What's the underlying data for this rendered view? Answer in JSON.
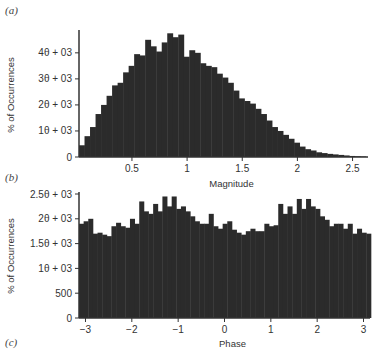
{
  "panels": {
    "a": "(a)",
    "b": "(b)",
    "c": "(c)"
  },
  "colors": {
    "bar": "#2b2b2b",
    "axis": "#333333",
    "text": "#333333"
  },
  "chart_data": [
    {
      "type": "bar",
      "panel": "(a)",
      "title": "",
      "xlabel": "Magnitude",
      "ylabel": "% of Occurrences",
      "xlim": [
        0.02,
        2.64
      ],
      "ylim": [
        0,
        4800
      ],
      "grid": false,
      "legend": null,
      "xticks": [
        0.5,
        1,
        1.5,
        2,
        2.5
      ],
      "xtick_labels": [
        "0.5",
        "1",
        "1.5",
        "2",
        "2.5"
      ],
      "yticks": [
        0,
        1000,
        2000,
        3000,
        4000
      ],
      "ytick_labels": [
        "0",
        "1θ + 03",
        "2θ + 03",
        "3θ + 03",
        "4θ + 03"
      ],
      "bin_width": 0.05,
      "x": [
        0.045,
        0.095,
        0.145,
        0.195,
        0.245,
        0.295,
        0.345,
        0.395,
        0.445,
        0.495,
        0.545,
        0.595,
        0.645,
        0.695,
        0.745,
        0.795,
        0.845,
        0.895,
        0.945,
        0.995,
        1.045,
        1.095,
        1.145,
        1.195,
        1.245,
        1.295,
        1.345,
        1.395,
        1.445,
        1.495,
        1.545,
        1.595,
        1.645,
        1.695,
        1.745,
        1.795,
        1.845,
        1.895,
        1.945,
        1.995,
        2.045,
        2.095,
        2.145,
        2.195,
        2.245,
        2.295,
        2.345,
        2.395,
        2.445,
        2.495,
        2.545,
        2.595
      ],
      "values": [
        450,
        800,
        1150,
        1650,
        2000,
        2350,
        2750,
        2850,
        3250,
        3500,
        3950,
        3900,
        4500,
        4250,
        4050,
        4400,
        4750,
        4600,
        4700,
        3850,
        4100,
        4000,
        3600,
        3500,
        3450,
        3200,
        3050,
        2850,
        2550,
        2250,
        2150,
        2050,
        1850,
        1650,
        1400,
        1150,
        1000,
        850,
        700,
        550,
        400,
        300,
        250,
        180,
        150,
        120,
        100,
        80,
        60,
        40,
        30,
        20
      ]
    },
    {
      "type": "bar",
      "panel": "(b)",
      "title": "",
      "xlabel": "Phase",
      "ylabel": "% of Occurrences",
      "xlim": [
        -3.14,
        3.14
      ],
      "ylim": [
        0,
        2500
      ],
      "grid": false,
      "legend": null,
      "xticks": [
        -3,
        -2,
        -1,
        0,
        1,
        2,
        3
      ],
      "xtick_labels": [
        "−3",
        "−2",
        "−1",
        "0",
        "1",
        "2",
        "3"
      ],
      "yticks": [
        0,
        500,
        1000,
        1500,
        2000,
        2500
      ],
      "ytick_labels": [
        "0",
        "500",
        "1θ + 03",
        "1.5θ + 03",
        "2θ + 03",
        "2.5θ + 03"
      ],
      "bin_width": 0.1,
      "x": [
        -3.09,
        -2.99,
        -2.89,
        -2.79,
        -2.69,
        -2.59,
        -2.49,
        -2.39,
        -2.29,
        -2.19,
        -2.09,
        -1.99,
        -1.89,
        -1.79,
        -1.69,
        -1.59,
        -1.49,
        -1.39,
        -1.29,
        -1.19,
        -1.09,
        -0.99,
        -0.89,
        -0.79,
        -0.69,
        -0.59,
        -0.49,
        -0.39,
        -0.29,
        -0.19,
        -0.09,
        0.01,
        0.11,
        0.21,
        0.31,
        0.41,
        0.51,
        0.61,
        0.71,
        0.81,
        0.91,
        1.01,
        1.11,
        1.21,
        1.31,
        1.41,
        1.51,
        1.61,
        1.71,
        1.81,
        1.91,
        2.01,
        2.11,
        2.21,
        2.31,
        2.41,
        2.51,
        2.61,
        2.71,
        2.81,
        2.91,
        3.01,
        3.11
      ],
      "values": [
        1900,
        1950,
        2000,
        1700,
        1720,
        1680,
        1650,
        1850,
        1920,
        1850,
        1820,
        2000,
        1900,
        2350,
        2150,
        2100,
        2300,
        2150,
        2450,
        2250,
        2450,
        2200,
        2250,
        2150,
        2050,
        1950,
        1900,
        1900,
        2100,
        1850,
        1800,
        1900,
        1950,
        1780,
        1720,
        1680,
        1750,
        1800,
        1750,
        1750,
        1900,
        1850,
        1870,
        2300,
        2100,
        2250,
        2100,
        2400,
        2200,
        2400,
        2250,
        2200,
        2050,
        1980,
        1850,
        1900,
        1900,
        1800,
        1900,
        1700,
        1800,
        1720,
        1700
      ]
    }
  ]
}
